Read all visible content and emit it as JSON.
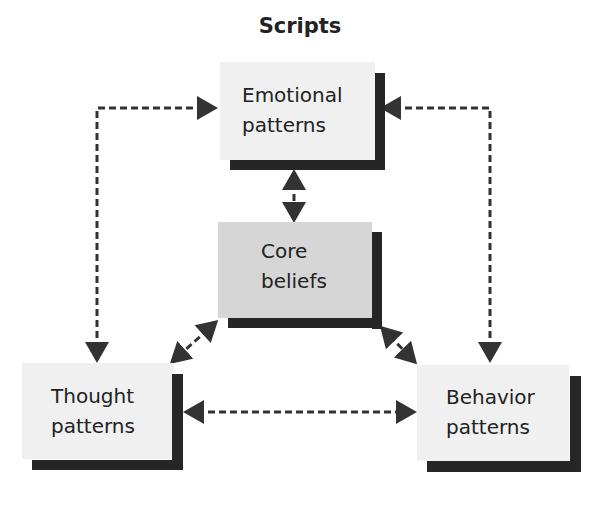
{
  "title": "Scripts",
  "nodes": {
    "emotional": {
      "line1": "Emotional",
      "line2": "patterns"
    },
    "core": {
      "line1": "Core",
      "line2": "beliefs"
    },
    "thought": {
      "line1": "Thought",
      "line2": "patterns"
    },
    "behavior": {
      "line1": "Behavior",
      "line2": "patterns"
    }
  },
  "colors": {
    "box_fill": "#f0f0f0",
    "core_fill": "#d6d6d6",
    "shadow": "#262626",
    "arrow": "#333333"
  }
}
